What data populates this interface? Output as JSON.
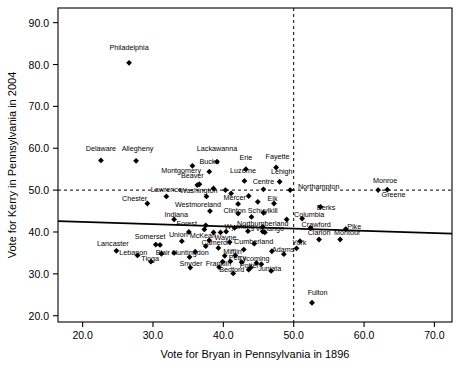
{
  "chart_data": {
    "type": "scatter",
    "title": "",
    "xlabel": "Vote for Bryan in Pennsylvania in 1896",
    "ylabel": "Vote for Kerry in Pennsylvania in 2004",
    "xlim": [
      16.5,
      72.5
    ],
    "ylim": [
      18.5,
      93.5
    ],
    "xticks": [
      20.0,
      30.0,
      40.0,
      50.0,
      60.0,
      70.0
    ],
    "yticks": [
      20.0,
      30.0,
      40.0,
      50.0,
      60.0,
      70.0,
      80.0,
      90.0
    ],
    "xtick_labels": [
      "20.0",
      "30.0",
      "40.0",
      "50.0",
      "60.0",
      "70.0"
    ],
    "ytick_labels": [
      "20.0",
      "30.0",
      "40.0",
      "50.0",
      "60.0",
      "70.0",
      "80.0",
      "90.0"
    ],
    "grid": false,
    "legend": "none",
    "reference_lines": [
      {
        "name": "horizontal-50-percent",
        "orientation": "horizontal",
        "value": 50.0,
        "style": "dashed"
      },
      {
        "name": "vertical-50-percent",
        "orientation": "vertical",
        "value": 50.0,
        "style": "dashed"
      }
    ],
    "trend_line": {
      "name": "regression-line",
      "style": "solid",
      "x0": 16.5,
      "y0": 42.6,
      "x1": 72.5,
      "y1": 39.6
    },
    "marker": "filled-diamond",
    "points": [
      {
        "label": "Philadelphia",
        "x": 26.6,
        "y": 80.4,
        "lx": 26.6,
        "ly": 83.4,
        "anchor": "middle"
      },
      {
        "label": "Delaware",
        "x": 22.6,
        "y": 57.1,
        "lx": 22.6,
        "ly": 59.4,
        "anchor": "middle"
      },
      {
        "label": "Allegheny",
        "x": 27.6,
        "y": 57.0,
        "lx": 27.8,
        "ly": 59.4,
        "anchor": "middle"
      },
      {
        "label": "Lackawanna",
        "x": 39.1,
        "y": 56.8,
        "lx": 39.1,
        "ly": 59.3,
        "anchor": "middle"
      },
      {
        "label": "Montgomery",
        "x": 35.6,
        "y": 55.8,
        "lx": 34.0,
        "ly": 54.0,
        "anchor": "middle"
      },
      {
        "label": "Bucks",
        "x": 38.0,
        "y": 54.4,
        "lx": 38.0,
        "ly": 56.3,
        "anchor": "middle"
      },
      {
        "label": "Erie",
        "x": 43.2,
        "y": 55.0,
        "lx": 43.2,
        "ly": 57.1,
        "anchor": "middle"
      },
      {
        "label": "Fayette",
        "x": 47.5,
        "y": 55.4,
        "lx": 47.7,
        "ly": 57.4,
        "anchor": "middle"
      },
      {
        "label": "Luzerne",
        "x": 43.0,
        "y": 52.2,
        "lx": 42.8,
        "ly": 54.1,
        "anchor": "middle"
      },
      {
        "label": "Lehigh",
        "x": 48.0,
        "y": 52.0,
        "lx": 48.3,
        "ly": 53.8,
        "anchor": "middle"
      },
      {
        "label": "Beaver",
        "x": 36.6,
        "y": 51.4,
        "lx": 35.6,
        "ly": 52.9,
        "anchor": "middle"
      },
      {
        "label": "Centre",
        "x": 45.7,
        "y": 50.2,
        "lx": 45.7,
        "ly": 51.5,
        "anchor": "middle"
      },
      {
        "label": "Northampton",
        "x": 49.5,
        "y": 50.0,
        "lx": 50.6,
        "ly": 50.2,
        "anchor": "start"
      },
      {
        "label": "Washington",
        "x": 37.6,
        "y": 48.5,
        "lx": 36.5,
        "ly": 49.4,
        "anchor": "middle"
      },
      {
        "label": "Lawrence",
        "x": 31.9,
        "y": 48.5,
        "lx": 31.9,
        "ly": 49.6,
        "anchor": "middle"
      },
      {
        "label": "Chester",
        "x": 29.2,
        "y": 46.8,
        "lx": 27.4,
        "ly": 47.5,
        "anchor": "middle"
      },
      {
        "label": "Monroe",
        "x": 62.0,
        "y": 50.0,
        "lx": 63.0,
        "ly": 51.8,
        "anchor": "middle"
      },
      {
        "label": "Greene",
        "x": 63.3,
        "y": 50.1,
        "lx": 64.2,
        "ly": 48.4,
        "anchor": "middle"
      },
      {
        "label": "Mercer",
        "x": 42.1,
        "y": 46.7,
        "lx": 41.6,
        "ly": 47.7,
        "anchor": "middle"
      },
      {
        "label": "Elk",
        "x": 47.2,
        "y": 46.8,
        "lx": 47.0,
        "ly": 47.5,
        "anchor": "middle"
      },
      {
        "label": "Westmoreland",
        "x": 38.1,
        "y": 45.0,
        "lx": 36.4,
        "ly": 45.9,
        "anchor": "middle"
      },
      {
        "label": "Clinton",
        "x": 42.1,
        "y": 44.4,
        "lx": 41.6,
        "ly": 44.6,
        "anchor": "middle"
      },
      {
        "label": "Schuylkill",
        "x": 45.7,
        "y": 44.6,
        "lx": 45.6,
        "ly": 44.6,
        "anchor": "middle"
      },
      {
        "label": "Berks",
        "x": 53.8,
        "y": 46.0,
        "lx": 54.6,
        "ly": 45.2,
        "anchor": "middle"
      },
      {
        "label": "Columbia",
        "x": 51.2,
        "y": 43.2,
        "lx": 52.2,
        "ly": 43.6,
        "anchor": "middle"
      },
      {
        "label": "Indiana",
        "x": 33.0,
        "y": 43.0,
        "lx": 33.3,
        "ly": 43.5,
        "anchor": "middle"
      },
      {
        "label": "Forest",
        "x": 37.5,
        "y": 41.6,
        "lx": 34.8,
        "ly": 41.5,
        "anchor": "middle"
      },
      {
        "label": "Northumberland",
        "x": 45.6,
        "y": 41.2,
        "lx": 45.6,
        "ly": 41.4,
        "anchor": "middle"
      },
      {
        "label": "Crawford",
        "x": 52.4,
        "y": 41.0,
        "lx": 53.2,
        "ly": 41.3,
        "anchor": "middle"
      },
      {
        "label": "Pike",
        "x": 57.4,
        "y": 40.7,
        "lx": 58.6,
        "ly": 40.7,
        "anchor": "middle"
      },
      {
        "label": "Wyoming",
        "x": 43.5,
        "y": 40.2,
        "lx": 42.3,
        "ly": 40.6,
        "anchor": "middle"
      },
      {
        "label": "Venango",
        "x": 45.6,
        "y": 40.1,
        "lx": 46.6,
        "ly": 40.2,
        "anchor": "middle"
      },
      {
        "label": "Clarion",
        "x": 53.6,
        "y": 38.2,
        "lx": 53.6,
        "ly": 39.2,
        "anchor": "middle"
      },
      {
        "label": "Montour",
        "x": 56.6,
        "y": 38.2,
        "lx": 57.6,
        "ly": 39.2,
        "anchor": "middle"
      },
      {
        "label": "Somerset",
        "x": 30.4,
        "y": 37.0,
        "lx": 29.6,
        "ly": 38.3,
        "anchor": "middle"
      },
      {
        "label": "Union",
        "x": 34.1,
        "y": 37.8,
        "lx": 33.6,
        "ly": 38.9,
        "anchor": "middle"
      },
      {
        "label": "McKean",
        "x": 38.0,
        "y": 38.0,
        "lx": 37.1,
        "ly": 38.5,
        "anchor": "middle"
      },
      {
        "label": "Wayne",
        "x": 40.9,
        "y": 37.6,
        "lx": 40.3,
        "ly": 38.0,
        "anchor": "middle"
      },
      {
        "label": "Cumberland",
        "x": 44.4,
        "y": 37.2,
        "lx": 44.3,
        "ly": 37.1,
        "anchor": "middle"
      },
      {
        "label": "Lancaster",
        "x": 24.8,
        "y": 35.5,
        "lx": 24.3,
        "ly": 36.6,
        "anchor": "middle"
      },
      {
        "label": "Lebanon",
        "x": 27.8,
        "y": 34.4,
        "lx": 27.2,
        "ly": 34.5,
        "anchor": "middle"
      },
      {
        "label": "Blair",
        "x": 31.2,
        "y": 34.8,
        "lx": 31.4,
        "ly": 34.5,
        "anchor": "middle"
      },
      {
        "label": "Cameron",
        "x": 39.3,
        "y": 36.2,
        "lx": 39.0,
        "ly": 37.0,
        "anchor": "middle"
      },
      {
        "label": "Huntingdon",
        "x": 35.2,
        "y": 34.0,
        "lx": 35.3,
        "ly": 34.4,
        "anchor": "middle"
      },
      {
        "label": "Mifflin",
        "x": 41.7,
        "y": 34.4,
        "lx": 41.3,
        "ly": 34.8,
        "anchor": "middle"
      },
      {
        "label": "York",
        "x": 50.4,
        "y": 36.1,
        "lx": 50.8,
        "ly": 36.8,
        "anchor": "middle"
      },
      {
        "label": "Tioga",
        "x": 29.7,
        "y": 32.9,
        "lx": 29.6,
        "ly": 33.1,
        "anchor": "middle"
      },
      {
        "label": "Perry",
        "x": 42.6,
        "y": 32.8,
        "lx": 42.0,
        "ly": 33.4,
        "anchor": "middle"
      },
      {
        "label": "Lycoming",
        "x": 44.7,
        "y": 32.6,
        "lx": 44.4,
        "ly": 33.1,
        "anchor": "middle"
      },
      {
        "label": "Adams",
        "x": 48.6,
        "y": 34.7,
        "lx": 48.5,
        "ly": 35.3,
        "anchor": "middle"
      },
      {
        "label": "Snyder",
        "x": 35.3,
        "y": 31.5,
        "lx": 35.4,
        "ly": 31.8,
        "anchor": "middle"
      },
      {
        "label": "Franklin",
        "x": 39.4,
        "y": 31.6,
        "lx": 39.3,
        "ly": 31.9,
        "anchor": "middle"
      },
      {
        "label": "Potter",
        "x": 43.9,
        "y": 31.5,
        "lx": 43.7,
        "ly": 31.4,
        "anchor": "middle"
      },
      {
        "label": "Juniata",
        "x": 46.8,
        "y": 30.7,
        "lx": 46.6,
        "ly": 30.8,
        "anchor": "middle"
      },
      {
        "label": "Bedford",
        "x": 41.4,
        "y": 30.1,
        "lx": 41.2,
        "ly": 30.5,
        "anchor": "middle"
      },
      {
        "label": "Fulton",
        "x": 52.6,
        "y": 23.1,
        "lx": 53.4,
        "ly": 24.9,
        "anchor": "middle"
      }
    ],
    "extra_points": [
      {
        "x": 31.0,
        "y": 36.9
      },
      {
        "x": 33.0,
        "y": 35.0
      },
      {
        "x": 36.0,
        "y": 35.3
      },
      {
        "x": 38.6,
        "y": 39.9
      },
      {
        "x": 39.6,
        "y": 39.9
      },
      {
        "x": 40.4,
        "y": 40.1
      },
      {
        "x": 37.3,
        "y": 40.6
      },
      {
        "x": 40.2,
        "y": 34.3
      },
      {
        "x": 42.9,
        "y": 35.8
      },
      {
        "x": 37.5,
        "y": 36.6
      },
      {
        "x": 39.9,
        "y": 32.9
      },
      {
        "x": 41.0,
        "y": 33.0
      },
      {
        "x": 43.6,
        "y": 31.0
      },
      {
        "x": 45.4,
        "y": 32.3
      },
      {
        "x": 46.9,
        "y": 35.4
      },
      {
        "x": 44.0,
        "y": 43.6
      },
      {
        "x": 43.6,
        "y": 48.6
      },
      {
        "x": 41.1,
        "y": 49.2
      },
      {
        "x": 40.3,
        "y": 50.0
      },
      {
        "x": 44.9,
        "y": 47.2
      },
      {
        "x": 49.0,
        "y": 43.0
      },
      {
        "x": 50.9,
        "y": 37.8
      },
      {
        "x": 45.9,
        "y": 39.9
      },
      {
        "x": 35.1,
        "y": 40.0
      },
      {
        "x": 36.3,
        "y": 51.2
      },
      {
        "x": 38.6,
        "y": 50.4
      },
      {
        "x": 41.6,
        "y": 41.0
      }
    ]
  }
}
